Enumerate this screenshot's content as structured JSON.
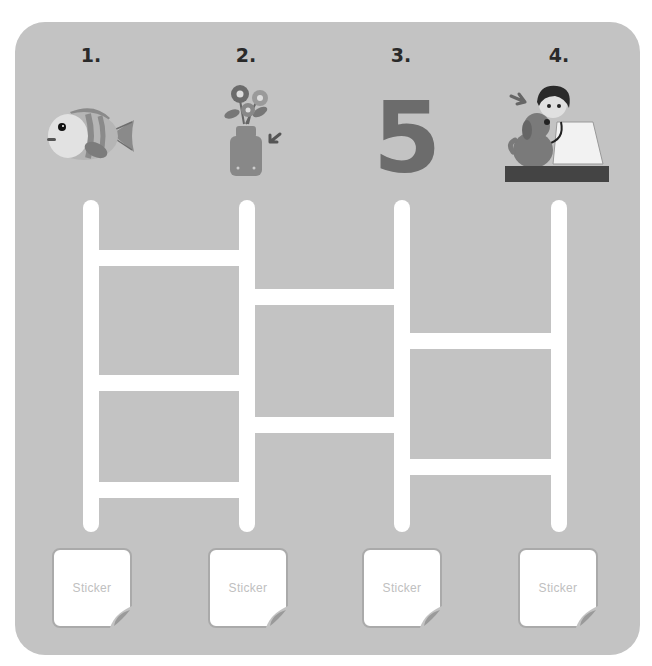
{
  "activity": {
    "columns": [
      {
        "number": "1.",
        "picture": "fish",
        "sticker_label": "Sticker"
      },
      {
        "number": "2.",
        "picture": "flowers-in-vase",
        "sticker_label": "Sticker"
      },
      {
        "number": "3.",
        "picture": "number-five",
        "picture_text": "5",
        "sticker_label": "Sticker"
      },
      {
        "number": "4.",
        "picture": "vet-examining-dog",
        "sticker_label": "Sticker"
      }
    ],
    "ladder": {
      "rails": 4,
      "rungs": [
        {
          "between": [
            1,
            2
          ],
          "y": 250
        },
        {
          "between": [
            1,
            2
          ],
          "y": 375
        },
        {
          "between": [
            1,
            2
          ],
          "y": 482
        },
        {
          "between": [
            2,
            3
          ],
          "y": 289
        },
        {
          "between": [
            2,
            3
          ],
          "y": 417
        },
        {
          "between": [
            3,
            4
          ],
          "y": 333
        },
        {
          "between": [
            3,
            4
          ],
          "y": 459
        }
      ]
    }
  },
  "colors": {
    "panel": "#c3c3c3",
    "ladder": "#ffffff",
    "number_text": "#2a2a2a",
    "sticker_text": "#c0c0c0"
  }
}
